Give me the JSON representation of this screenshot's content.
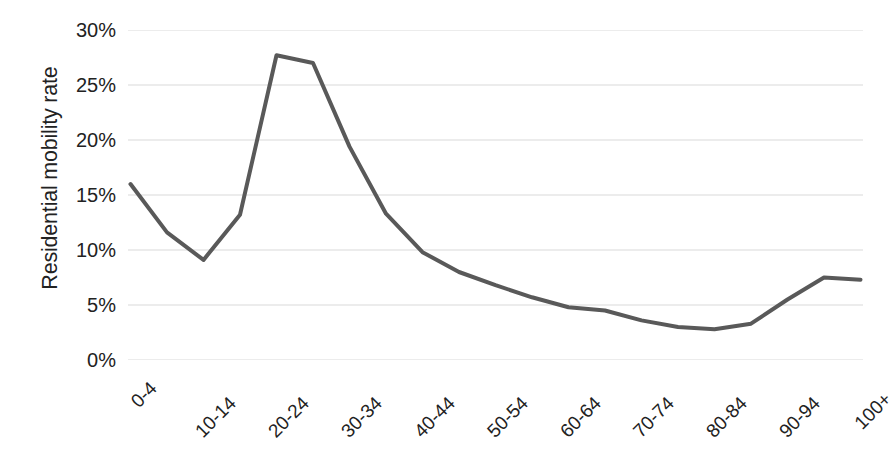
{
  "chart_data": {
    "type": "line",
    "title": "",
    "xlabel": "",
    "ylabel": "Residential mobility rate",
    "categories": [
      "0-4",
      "5-9",
      "10-14",
      "15-19",
      "20-24",
      "25-29",
      "30-34",
      "35-39",
      "40-44",
      "45-49",
      "50-54",
      "55-59",
      "60-64",
      "65-69",
      "70-74",
      "75-79",
      "80-84",
      "85-89",
      "90-94",
      "95-99",
      "100+"
    ],
    "values": [
      16.0,
      11.6,
      9.1,
      13.2,
      27.7,
      27.0,
      19.4,
      13.3,
      9.8,
      8.0,
      6.8,
      5.7,
      4.8,
      4.5,
      3.6,
      3.0,
      2.8,
      3.3,
      5.5,
      7.5,
      7.3
    ],
    "value_unit": "%",
    "ylim": [
      0,
      30
    ],
    "ytick_values": [
      0,
      5,
      10,
      15,
      20,
      25,
      30
    ],
    "ytick_labels": [
      "0%",
      "5%",
      "10%",
      "15%",
      "20%",
      "25%",
      "30%"
    ],
    "xtick_labels": [
      "0-4",
      "10-14",
      "20-24",
      "30-34",
      "40-44",
      "50-54",
      "60-64",
      "70-74",
      "80-84",
      "90-94",
      "100+"
    ],
    "xtick_label_indices": [
      0,
      2,
      4,
      6,
      8,
      10,
      12,
      14,
      16,
      18,
      20
    ],
    "grid": "horizontal",
    "legend": "none",
    "series_color": "#595959",
    "gridline_color": "#d9d9d9",
    "background_color": "#ffffff",
    "line_width": 4
  }
}
